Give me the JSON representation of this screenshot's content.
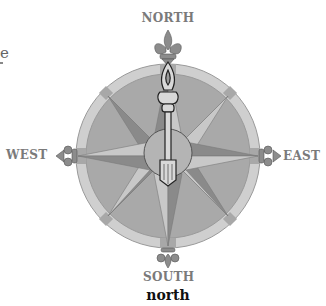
{
  "figure": {
    "type": "compass-rose-illustration",
    "labels": {
      "north": "NORTH",
      "south": "SOUTH",
      "east": "EAST",
      "west": "WEST"
    },
    "needle_direction": "north",
    "caption": "north",
    "left_edge_fragment": "e"
  },
  "colors": {
    "ring": "#cfcfcf",
    "ring_markers": "#a8a8a8",
    "face": "#a9a9a9",
    "star_light": "#c8c8c8",
    "star_dark": "#8a8a8a",
    "center_disc": "#b4b4b4",
    "needle": "#d8d8d8",
    "outline": "#333333",
    "label_text": "#7a7a7a",
    "caption_text": "#111111"
  }
}
